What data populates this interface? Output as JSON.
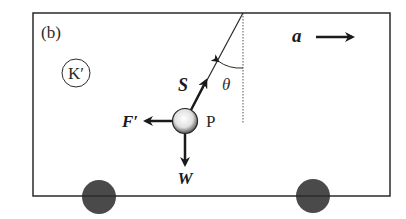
{
  "figure": {
    "panel_label": "(b)",
    "frame_label": "K′",
    "acceleration_label": "a",
    "tension_label": "S",
    "angle_label": "θ",
    "fictitious_force_label": "F′",
    "particle_label": "P",
    "weight_label": "W"
  },
  "colors": {
    "line": "#2a2a2a",
    "wheel": "#4a4a4a",
    "background": "#ffffff"
  }
}
